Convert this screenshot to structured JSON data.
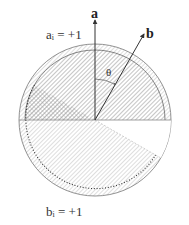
{
  "diagram": {
    "type": "vector-measurement-disk",
    "labels": {
      "vector_a": "a",
      "vector_b": "b",
      "angle": "θ",
      "a_outcome": {
        "base": "a",
        "subscript": "i",
        "rest": " = +1"
      },
      "b_outcome": {
        "base": "b",
        "subscript": "i",
        "rest": " = +1"
      }
    },
    "geometry": {
      "center": [
        95,
        120
      ],
      "outer_radius": 76,
      "inner_radius": 70,
      "vector_a_angle_deg": 90,
      "vector_b_angle_deg": 60,
      "theta_deg": 30
    },
    "colors": {
      "line": "#555555",
      "hatch": "#9a9a9a",
      "text": "#333333"
    }
  }
}
